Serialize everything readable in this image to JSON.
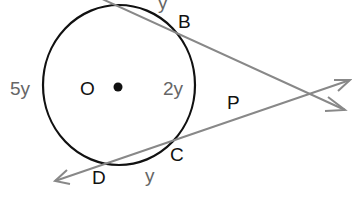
{
  "diagram": {
    "center_label": "O",
    "points": {
      "B": "B",
      "C": "C",
      "D": "D",
      "P": "P"
    },
    "arc_labels": {
      "top": "y",
      "left": "5y",
      "right": "2y",
      "bottom": "y"
    },
    "colors": {
      "circle": "#111111",
      "lines": "#888888",
      "labels": "#111111",
      "arc_labels": "#666666"
    }
  }
}
